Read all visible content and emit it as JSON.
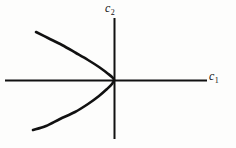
{
  "figure": {
    "background_color": "#fdfdfc",
    "ink_color": "#111111",
    "width": 236,
    "height": 148
  },
  "labels": {
    "x_axis": {
      "base": "c",
      "subscript": "1",
      "full": "c1"
    },
    "y_axis": {
      "base": "c",
      "subscript": "2",
      "full": "c2"
    }
  },
  "chart_data": {
    "type": "line",
    "title": "",
    "subtitle": "",
    "xlabel": "c1",
    "ylabel": "c2",
    "grid": false,
    "legend": null,
    "axes": {
      "x_axis": {
        "orientation": "horizontal",
        "y_pixel": 80,
        "x_start_pixel": 5,
        "x_end_pixel": 207,
        "stroke_width": 2,
        "color": "#111111",
        "arrowhead": false,
        "ticks": [],
        "tick_labels": []
      },
      "y_axis": {
        "orientation": "vertical",
        "x_pixel": 114,
        "y_start_pixel": 18,
        "y_end_pixel": 139,
        "stroke_width": 2,
        "color": "#111111",
        "arrowhead": false,
        "ticks": [],
        "tick_labels": []
      },
      "origin_pixel": {
        "x": 114,
        "y": 80
      }
    },
    "series": [
      {
        "name": "parabola",
        "description": "leftward-opening parabola with vertex at the origin",
        "equation": "c1 = -k * c2^2",
        "opens": "left",
        "vertex": {
          "x": 114,
          "y": 80
        },
        "color": "#111111",
        "stroke_width": 2.6,
        "closed": false,
        "points": [
          {
            "x": 36,
            "y": 32
          },
          {
            "x": 48,
            "y": 38
          },
          {
            "x": 62,
            "y": 45
          },
          {
            "x": 76,
            "y": 53
          },
          {
            "x": 88,
            "y": 60
          },
          {
            "x": 99,
            "y": 67
          },
          {
            "x": 107,
            "y": 73
          },
          {
            "x": 112,
            "y": 77
          },
          {
            "x": 114,
            "y": 80
          },
          {
            "x": 112,
            "y": 84
          },
          {
            "x": 107,
            "y": 89
          },
          {
            "x": 99,
            "y": 96
          },
          {
            "x": 88,
            "y": 104
          },
          {
            "x": 75,
            "y": 112
          },
          {
            "x": 60,
            "y": 119
          },
          {
            "x": 46,
            "y": 126
          },
          {
            "x": 33,
            "y": 130
          }
        ]
      }
    ],
    "xlim": [
      null,
      null
    ],
    "ylim": [
      null,
      null
    ]
  }
}
